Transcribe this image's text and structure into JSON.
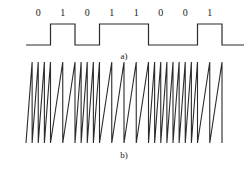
{
  "figure": {
    "stroke_color": "#2b2b2b",
    "background_color": "#ffffff",
    "text_color": "#1a1a1a"
  },
  "panel_a": {
    "label": "a)",
    "bits": [
      "0",
      "1",
      "0",
      "1",
      "1",
      "0",
      "0",
      "1"
    ],
    "description": "binary data square wave"
  },
  "panel_b": {
    "label": "b)",
    "description": "sawtooth carrier FSK signal"
  },
  "chart_data": {
    "type": "line",
    "xlabel": "",
    "ylabel": "",
    "grid": false,
    "legend": "none",
    "panels": [
      {
        "id": "a",
        "label": "a)",
        "type": "line",
        "name": "binary data square wave",
        "categories": [
          "0",
          "1",
          "0",
          "1",
          "1",
          "0",
          "0",
          "1"
        ],
        "values": [
          0,
          1,
          0,
          1,
          1,
          0,
          0,
          1
        ],
        "ylim": [
          0,
          1
        ],
        "x_start": 26,
        "x_end": 222,
        "bit_width": 24.5,
        "low_y": 45,
        "high_y": 24,
        "transitions": [
          {
            "x": 26,
            "level": 0
          },
          {
            "x": 50.5,
            "level": 1
          },
          {
            "x": 75,
            "level": 0
          },
          {
            "x": 99.5,
            "level": 1
          },
          {
            "x": 148.5,
            "level": 0
          },
          {
            "x": 197.5,
            "level": 1
          },
          {
            "x": 222,
            "level": 0
          }
        ]
      },
      {
        "id": "b",
        "label": "b)",
        "type": "line",
        "name": "sawtooth carrier FSK signal",
        "categories": [
          "0",
          "1",
          "0",
          "1",
          "1",
          "0",
          "0",
          "1"
        ],
        "teeth_per_bit": [
          4,
          2,
          4,
          2,
          2,
          4,
          4,
          2
        ],
        "frequency_mark": "low",
        "frequency_space": "high",
        "x_start": 26,
        "x_end": 222,
        "bit_width": 24.5,
        "top_y": 62,
        "bottom_y": 143,
        "amplitude": 81,
        "waveform": "sawtooth ramp up"
      }
    ]
  }
}
